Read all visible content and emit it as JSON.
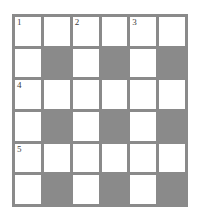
{
  "puzzle": {
    "type": "crossword-grid",
    "rows": 6,
    "columns": 6,
    "colors": {
      "block": "#8a8a8a",
      "open_cell": "#ffffff",
      "grid_line": "#8a8a8a",
      "number_text": "#3c3c3c",
      "page_background": "#ffffff"
    },
    "cells": [
      [
        {
          "shaded": false,
          "number": "1"
        },
        {
          "shaded": false,
          "number": ""
        },
        {
          "shaded": false,
          "number": "2"
        },
        {
          "shaded": false,
          "number": ""
        },
        {
          "shaded": false,
          "number": "3"
        },
        {
          "shaded": false,
          "number": ""
        }
      ],
      [
        {
          "shaded": false,
          "number": ""
        },
        {
          "shaded": true,
          "number": ""
        },
        {
          "shaded": false,
          "number": ""
        },
        {
          "shaded": true,
          "number": ""
        },
        {
          "shaded": false,
          "number": ""
        },
        {
          "shaded": true,
          "number": ""
        }
      ],
      [
        {
          "shaded": false,
          "number": "4"
        },
        {
          "shaded": false,
          "number": ""
        },
        {
          "shaded": false,
          "number": ""
        },
        {
          "shaded": false,
          "number": ""
        },
        {
          "shaded": false,
          "number": ""
        },
        {
          "shaded": false,
          "number": ""
        }
      ],
      [
        {
          "shaded": false,
          "number": ""
        },
        {
          "shaded": true,
          "number": ""
        },
        {
          "shaded": false,
          "number": ""
        },
        {
          "shaded": true,
          "number": ""
        },
        {
          "shaded": false,
          "number": ""
        },
        {
          "shaded": true,
          "number": ""
        }
      ],
      [
        {
          "shaded": false,
          "number": "5"
        },
        {
          "shaded": false,
          "number": ""
        },
        {
          "shaded": false,
          "number": ""
        },
        {
          "shaded": false,
          "number": ""
        },
        {
          "shaded": false,
          "number": ""
        },
        {
          "shaded": false,
          "number": ""
        }
      ],
      [
        {
          "shaded": false,
          "number": ""
        },
        {
          "shaded": true,
          "number": ""
        },
        {
          "shaded": false,
          "number": ""
        },
        {
          "shaded": true,
          "number": ""
        },
        {
          "shaded": false,
          "number": ""
        },
        {
          "shaded": true,
          "number": ""
        }
      ]
    ]
  }
}
